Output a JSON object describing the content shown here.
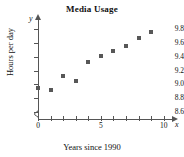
{
  "chart_data": {
    "type": "scatter",
    "title": "Media Usage",
    "xlabel": "Years since 1990",
    "ylabel": "Hours per day",
    "x_axis_variable": "x",
    "y_axis_variable": "y",
    "x": [
      0,
      1,
      2,
      3,
      4,
      5,
      6,
      7,
      8,
      9
    ],
    "values": [
      8.95,
      8.92,
      9.12,
      9.05,
      9.32,
      9.41,
      9.48,
      9.56,
      9.67,
      9.76
    ],
    "xlim": [
      0,
      10.5
    ],
    "ylim": [
      8.5,
      9.9
    ],
    "x_tick_values": [
      0,
      1,
      2,
      3,
      4,
      5,
      6,
      7,
      8,
      9,
      10
    ],
    "x_tick_labels": [
      "0",
      "",
      "",
      "",
      "",
      "5",
      "",
      "",
      "",
      "",
      "10"
    ],
    "y_tick_values": [
      8.6,
      8.8,
      9.0,
      9.2,
      9.4,
      9.6,
      9.8
    ],
    "y_tick_labels": [
      "8.6",
      "8.8",
      "9.0",
      "9.2",
      "9.4",
      "9.6",
      "9.8"
    ],
    "grid": false,
    "legend": false,
    "y_axis_break": true,
    "marker": "square",
    "marker_color": "#575757",
    "axis_color": "#555555"
  }
}
